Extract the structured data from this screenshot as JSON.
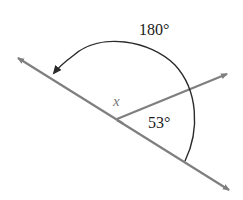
{
  "diagram": {
    "type": "angle-diagram",
    "labels": {
      "straight_angle": "180°",
      "unknown_angle": "x",
      "known_angle": "53°"
    },
    "elements": [
      {
        "id": "main-line",
        "kind": "line with arrows at both ends",
        "from": [
          16,
          57
        ],
        "to": [
          230,
          190
        ]
      },
      {
        "id": "ray",
        "kind": "ray with arrow",
        "from": [
          117,
          118
        ],
        "to": [
          228,
          74
        ]
      },
      {
        "id": "arc",
        "kind": "arc with arrowhead",
        "label": "180°"
      }
    ],
    "colors": {
      "lines": "#7f7f7f",
      "arc": "#2a2a2a",
      "text": "#1a1a1a",
      "x_label": "#777777"
    }
  }
}
